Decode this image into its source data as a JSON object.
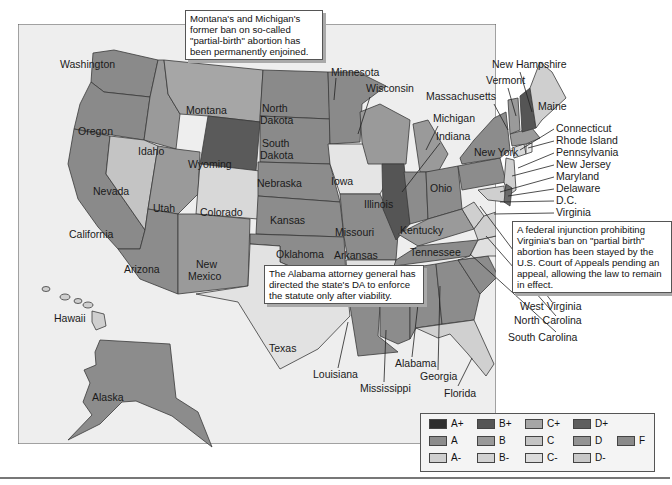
{
  "map": {
    "title": "",
    "background_color": "#eeeeee",
    "border_color": "#555555"
  },
  "callouts": {
    "montana_michigan": "Montana's and Michigan's former ban on so-called \"partial-birth\" abortion has been permanently enjoined.",
    "virginia": "A federal injunction prohibiting Virginia's ban on \"partial birth\" abortion has been stayed by the U.S. Court of Appeals pending an appeal, allowing the law to remain in effect.",
    "alabama": "The Alabama attorney general has directed the state's DA to enforce the statute only after viability."
  },
  "states": {
    "washington": "Washington",
    "oregon": "Oregon",
    "california": "California",
    "idaho": "Idaho",
    "nevada": "Nevada",
    "montana": "Montana",
    "wyoming": "Wyoming",
    "utah": "Utah",
    "arizona": "Arizona",
    "colorado": "Colorado",
    "new_mexico_1": "New",
    "new_mexico_2": "Mexico",
    "north_dakota_1": "North",
    "north_dakota_2": "Dakota",
    "south_dakota_1": "South",
    "south_dakota_2": "Dakota",
    "nebraska": "Nebraska",
    "kansas": "Kansas",
    "oklahoma": "Oklahoma",
    "texas": "Texas",
    "minnesota": "Minnesota",
    "iowa": "Iowa",
    "missouri": "Missouri",
    "arkansas": "Arkansas",
    "louisiana": "Louisiana",
    "wisconsin": "Wisconsin",
    "illinois": "Illinois",
    "michigan": "Michigan",
    "indiana": "Indiana",
    "ohio": "Ohio",
    "kentucky": "Kentucky",
    "tennessee": "Tennessee",
    "mississippi": "Mississippi",
    "alabama": "Alabama",
    "georgia": "Georgia",
    "florida": "Florida",
    "south_carolina": "South Carolina",
    "north_carolina": "North Carolina",
    "west_virginia": "West Virginia",
    "virginia": "Virginia",
    "dc": "D.C.",
    "delaware": "Delaware",
    "maryland": "Maryland",
    "new_jersey": "New Jersey",
    "pennsylvania": "Pennsylvania",
    "rhode_island": "Rhode Island",
    "connecticut": "Connecticut",
    "new_york": "New York",
    "massachusetts": "Massachusetts",
    "vermont": "Vermont",
    "new_hampshire": "New Hampshire",
    "maine": "Maine",
    "hawaii": "Hawaii",
    "alaska": "Alaska"
  },
  "legend": {
    "items": [
      {
        "label": "A+",
        "color": "#2e2e2e"
      },
      {
        "label": "A",
        "color": "#8c8c8c"
      },
      {
        "label": "A-",
        "color": "#cfcfcf"
      },
      {
        "label": "B+",
        "color": "#555555"
      },
      {
        "label": "B",
        "color": "#999999"
      },
      {
        "label": "B-",
        "color": "#d2d2d2"
      },
      {
        "label": "C+",
        "color": "#a6a6a6"
      },
      {
        "label": "C",
        "color": "#c4c4c4"
      },
      {
        "label": "C-",
        "color": "#dcdcdc"
      },
      {
        "label": "D+",
        "color": "#5e5e5e"
      },
      {
        "label": "D",
        "color": "#939393"
      },
      {
        "label": "D-",
        "color": "#c8c8c8"
      },
      {
        "label": "F",
        "color": "#8a8a8a"
      }
    ]
  }
}
